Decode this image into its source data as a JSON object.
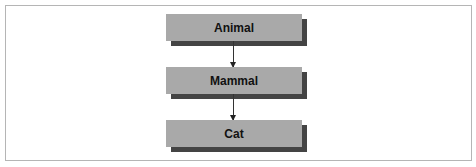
{
  "diagram": {
    "type": "hierarchy",
    "direction": "top-to-bottom",
    "nodes": [
      {
        "id": "animal",
        "label": "Animal"
      },
      {
        "id": "mammal",
        "label": "Mammal"
      },
      {
        "id": "cat",
        "label": "Cat"
      }
    ],
    "edges": [
      {
        "from": "animal",
        "to": "mammal"
      },
      {
        "from": "mammal",
        "to": "cat"
      }
    ],
    "colors": {
      "node_fill": "#a9a9a9",
      "node_shadow": "#444444",
      "edge": "#333333",
      "frame_border": "#b5b5b5"
    }
  }
}
